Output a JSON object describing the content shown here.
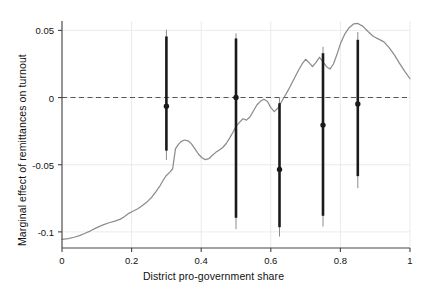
{
  "chart_data": {
    "type": "line",
    "title": "",
    "xlabel": "District pro-government share",
    "ylabel": "Marginal effect of remittances on turnout",
    "xlim": [
      0,
      1
    ],
    "ylim": [
      -0.112,
      0.057
    ],
    "grid": true,
    "legend_position": "none",
    "colors": {
      "curve": "#8c8c8c",
      "errorbar": "#1a1a1a",
      "errorbar_outer": "#8c8c8c",
      "zero_line": "#555555",
      "grid": "#e6e6e6",
      "axis": "#444444"
    },
    "xticks": [
      0,
      0.2,
      0.4,
      0.6,
      0.8,
      1
    ],
    "xticklabels": [
      "0",
      "0.2",
      "0.4",
      "0.6",
      "0.8",
      "1"
    ],
    "yticks": [
      0.05,
      0,
      -0.05,
      -0.1
    ],
    "yticklabels": [
      "0.05",
      "0",
      "-0.05",
      "-0.1"
    ],
    "zero_reference_line": 0,
    "series": [
      {
        "name": "Marginal effect (smoothed)",
        "type": "line",
        "x": [
          0.0,
          0.018,
          0.035,
          0.05,
          0.065,
          0.082,
          0.1,
          0.118,
          0.135,
          0.152,
          0.168,
          0.18,
          0.192,
          0.205,
          0.218,
          0.232,
          0.245,
          0.258,
          0.27,
          0.282,
          0.292,
          0.3,
          0.31,
          0.318,
          0.326,
          0.334,
          0.342,
          0.352,
          0.362,
          0.372,
          0.382,
          0.392,
          0.402,
          0.412,
          0.422,
          0.432,
          0.442,
          0.452,
          0.462,
          0.472,
          0.482,
          0.492,
          0.5,
          0.51,
          0.52,
          0.53,
          0.54,
          0.55,
          0.56,
          0.57,
          0.58,
          0.59,
          0.6,
          0.61,
          0.62,
          0.63,
          0.64,
          0.65,
          0.66,
          0.67,
          0.68,
          0.69,
          0.7,
          0.71,
          0.72,
          0.73,
          0.74,
          0.75,
          0.76,
          0.77,
          0.78,
          0.79,
          0.8,
          0.812,
          0.825,
          0.838,
          0.85,
          0.865,
          0.88,
          0.895,
          0.91,
          0.925,
          0.94,
          0.955,
          0.97,
          0.985,
          1.0
        ],
        "y": [
          -0.1055,
          -0.105,
          -0.104,
          -0.1028,
          -0.1012,
          -0.0992,
          -0.0968,
          -0.0948,
          -0.0932,
          -0.092,
          -0.0905,
          -0.0885,
          -0.0862,
          -0.0845,
          -0.0828,
          -0.0802,
          -0.0775,
          -0.0742,
          -0.07,
          -0.0655,
          -0.061,
          -0.058,
          -0.0555,
          -0.053,
          -0.0382,
          -0.035,
          -0.0328,
          -0.0316,
          -0.0322,
          -0.0345,
          -0.0382,
          -0.042,
          -0.0448,
          -0.0462,
          -0.0455,
          -0.043,
          -0.0408,
          -0.039,
          -0.0372,
          -0.0342,
          -0.03,
          -0.0255,
          -0.0215,
          -0.0185,
          -0.0158,
          -0.0168,
          -0.0145,
          -0.01,
          -0.0055,
          -0.0028,
          -0.0012,
          -0.0028,
          -0.0075,
          -0.0105,
          -0.008,
          -0.0035,
          0.001,
          0.0055,
          0.0105,
          0.0155,
          0.0205,
          0.025,
          0.0285,
          0.026,
          0.023,
          0.0262,
          0.03,
          0.0265,
          0.023,
          0.0212,
          0.025,
          0.032,
          0.04,
          0.047,
          0.052,
          0.0548,
          0.0552,
          0.053,
          0.049,
          0.0455,
          0.0435,
          0.0415,
          0.0372,
          0.0318,
          0.0255,
          0.0195,
          0.014
        ]
      }
    ],
    "error_bars": [
      {
        "x": 0.3,
        "y": -0.0065,
        "ci_inner_low": -0.0395,
        "ci_inner_high": 0.0455,
        "ci_outer_low": -0.0465,
        "ci_outer_high": 0.0505
      },
      {
        "x": 0.5,
        "y": 0.0,
        "ci_inner_low": -0.0895,
        "ci_inner_high": 0.044,
        "ci_outer_low": -0.098,
        "ci_outer_high": 0.0478
      },
      {
        "x": 0.625,
        "y": -0.0535,
        "ci_inner_low": -0.0965,
        "ci_inner_high": -0.0042,
        "ci_outer_low": -0.1035,
        "ci_outer_high": 0.0002
      },
      {
        "x": 0.75,
        "y": -0.0205,
        "ci_inner_low": -0.088,
        "ci_inner_high": 0.033,
        "ci_outer_low": -0.096,
        "ci_outer_high": 0.0378
      },
      {
        "x": 0.85,
        "y": -0.0048,
        "ci_inner_low": -0.0585,
        "ci_inner_high": 0.043,
        "ci_outer_low": -0.0675,
        "ci_outer_high": 0.0488
      }
    ]
  },
  "axes": {
    "x_title": "District pro-government share",
    "y_title": "Marginal effect of remittances on turnout"
  }
}
